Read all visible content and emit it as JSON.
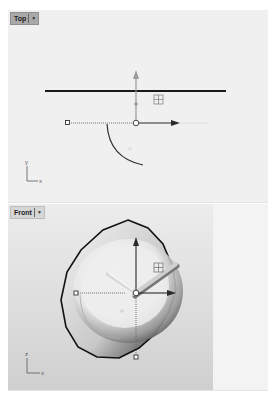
{
  "viewports": [
    {
      "name": "top",
      "label": "Top",
      "axes": {
        "vertical": "y",
        "horizontal": "x"
      }
    },
    {
      "name": "front",
      "label": "Front",
      "axes": {
        "vertical": "z",
        "horizontal": "x"
      }
    }
  ],
  "icons": {
    "viewport_menu": "caret-down-icon",
    "gumball": "gumball-widget-icon",
    "grid_snap": "grid-handle-icon"
  },
  "colors": {
    "viewport_bg": "#f0f0f0",
    "label_bg": "#a9a9a9",
    "curve": "#1a1a1a",
    "axis_arrow": "#333333",
    "gumball_y_top": "#888888"
  }
}
